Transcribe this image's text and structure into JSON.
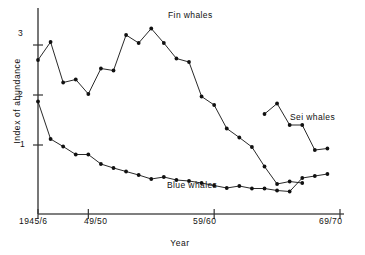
{
  "chart_data": {
    "type": "line",
    "title": "",
    "xlabel": "Year",
    "ylabel": "Index of abundance",
    "xlim": [
      1945,
      1969
    ],
    "ylim": [
      0,
      3.5
    ],
    "grid": false,
    "legend_position": "inline-annotations",
    "x_tick_labels": [
      "1945/6",
      "49/50",
      "59/60",
      "69/70"
    ],
    "x_tick_values": [
      1945,
      1949,
      1959,
      1969
    ],
    "y_tick_labels": [
      "1",
      "2",
      "3"
    ],
    "y_tick_values": [
      1,
      2,
      3
    ],
    "series": [
      {
        "name": "Fin whales",
        "x": [
          1945,
          1946,
          1947,
          1948,
          1949,
          1950,
          1951,
          1952,
          1953,
          1954,
          1955,
          1956,
          1957,
          1958,
          1959,
          1960,
          1961,
          1962,
          1963,
          1964,
          1965,
          1966
        ],
        "values": [
          2.7,
          3.06,
          2.25,
          2.31,
          2.02,
          2.53,
          2.49,
          3.2,
          3.04,
          3.33,
          3.04,
          2.73,
          2.66,
          1.97,
          1.8,
          1.33,
          1.15,
          0.96,
          0.57,
          0.22,
          0.27,
          0.24
        ]
      },
      {
        "name": "Blue whales",
        "x": [
          1945,
          1946,
          1947,
          1948,
          1949,
          1950,
          1951,
          1952,
          1953,
          1954,
          1955,
          1956,
          1957,
          1958,
          1959,
          1960,
          1961,
          1962,
          1963,
          1964,
          1965,
          1966,
          1967,
          1968
        ],
        "values": [
          1.87,
          1.12,
          0.97,
          0.81,
          0.81,
          0.62,
          0.54,
          0.47,
          0.4,
          0.32,
          0.36,
          0.3,
          0.28,
          0.24,
          0.19,
          0.14,
          0.18,
          0.13,
          0.13,
          0.09,
          0.07,
          0.34,
          0.38,
          0.42
        ]
      },
      {
        "name": "Sei whales",
        "x": [
          1963,
          1964,
          1965,
          1966,
          1967,
          1968
        ],
        "values": [
          1.62,
          1.83,
          1.4,
          1.4,
          0.9,
          0.93
        ]
      }
    ]
  },
  "annotations": {
    "fin_label": "Fin whales",
    "sei_label": "Sei whales",
    "blue_label": "Blue whales"
  },
  "axes": {
    "x_title": "Year",
    "y_title": "Index of abundance",
    "x_ticks": [
      "1945/6",
      "49/50",
      "59/60",
      "69/70"
    ],
    "y_ticks": [
      "3",
      "2",
      "1"
    ]
  },
  "style": {
    "line_color": "#111111",
    "marker_color": "#111111",
    "axis_color": "#444444",
    "background": "#ffffff"
  }
}
